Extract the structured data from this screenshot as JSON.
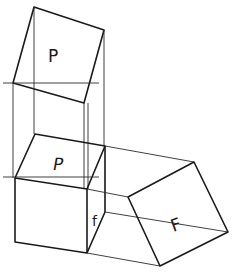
{
  "diagram": {
    "title": "",
    "labels": {
      "upper_square": "P",
      "cube_top": "P",
      "cube_side": "f",
      "right_square": "F"
    },
    "colors": {
      "line": "#1a1a1a",
      "background": "#ffffff"
    }
  }
}
